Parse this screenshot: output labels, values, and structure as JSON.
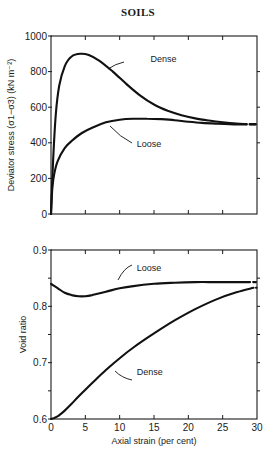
{
  "page": {
    "header": "SOILS"
  },
  "chart_data": [
    {
      "type": "line",
      "title": "",
      "xlabel": "Axial strain (per cent)",
      "ylabel": "Deviator stress (σ1−σ3) (kN m⁻²)",
      "xlim": [
        0,
        30
      ],
      "ylim": [
        0,
        1000
      ],
      "xticks": [
        0,
        5,
        10,
        15,
        20,
        25,
        30
      ],
      "yticks": [
        0,
        200,
        400,
        600,
        800,
        1000
      ],
      "ytick_labels": [
        "0",
        "200",
        "400",
        "600",
        "800",
        "1000"
      ],
      "grid": false,
      "legend": "inline annotations",
      "series": [
        {
          "name": "Dense",
          "x": [
            0,
            0.3,
            0.7,
            1.2,
            2,
            3,
            4.3,
            5.5,
            7,
            9,
            11,
            13,
            15,
            17,
            19,
            21,
            23,
            25,
            27,
            28.5
          ],
          "y": [
            0,
            300,
            560,
            720,
            830,
            885,
            900,
            893,
            862,
            800,
            730,
            665,
            615,
            580,
            555,
            537,
            525,
            515,
            508,
            505
          ]
        },
        {
          "name": "Loose",
          "x": [
            0,
            0.2,
            0.5,
            1,
            2,
            3,
            4.5,
            6,
            8,
            10,
            12,
            14,
            16,
            18,
            20,
            22,
            24,
            26,
            28.5
          ],
          "y": [
            0,
            150,
            230,
            300,
            370,
            410,
            455,
            485,
            515,
            530,
            535,
            535,
            533,
            527,
            518,
            512,
            508,
            505,
            503
          ]
        }
      ],
      "annotations": [
        {
          "text": "Dense",
          "x": 14.5,
          "y": 870
        },
        {
          "text": "Loose",
          "x": 12.5,
          "y": 395
        }
      ]
    },
    {
      "type": "line",
      "title": "",
      "xlabel": "Axial strain (per cent)",
      "ylabel": "Void ratio",
      "xlim": [
        0,
        30
      ],
      "ylim": [
        0.6,
        0.9
      ],
      "xticks": [
        0,
        5,
        10,
        15,
        20,
        25,
        30
      ],
      "xtick_labels": [
        "0",
        "5",
        "10",
        "15",
        "20",
        "25",
        "30"
      ],
      "yticks": [
        0.6,
        0.7,
        0.8,
        0.9
      ],
      "ytick_labels": [
        "0.6",
        "0.7",
        "0.8",
        "0.9"
      ],
      "grid": false,
      "legend": "inline annotations",
      "series": [
        {
          "name": "Loose",
          "x": [
            0,
            1,
            2,
            3,
            4,
            5,
            6,
            8,
            10,
            12,
            15,
            18,
            21,
            24,
            27,
            29
          ],
          "y": [
            0.84,
            0.832,
            0.824,
            0.82,
            0.818,
            0.818,
            0.82,
            0.826,
            0.832,
            0.836,
            0.84,
            0.842,
            0.843,
            0.843,
            0.843,
            0.843
          ]
        },
        {
          "name": "Dense",
          "x": [
            0,
            0.5,
            1,
            2,
            3,
            4,
            5,
            6,
            8,
            10,
            12,
            15,
            18,
            21,
            24,
            27,
            29.5
          ],
          "y": [
            0.6,
            0.602,
            0.605,
            0.615,
            0.627,
            0.64,
            0.652,
            0.664,
            0.687,
            0.708,
            0.727,
            0.752,
            0.775,
            0.795,
            0.812,
            0.825,
            0.833
          ]
        }
      ],
      "annotations": [
        {
          "text": "Loose",
          "x": 12.5,
          "y": 0.868
        },
        {
          "text": "Dense",
          "x": 12.5,
          "y": 0.683
        }
      ]
    }
  ]
}
